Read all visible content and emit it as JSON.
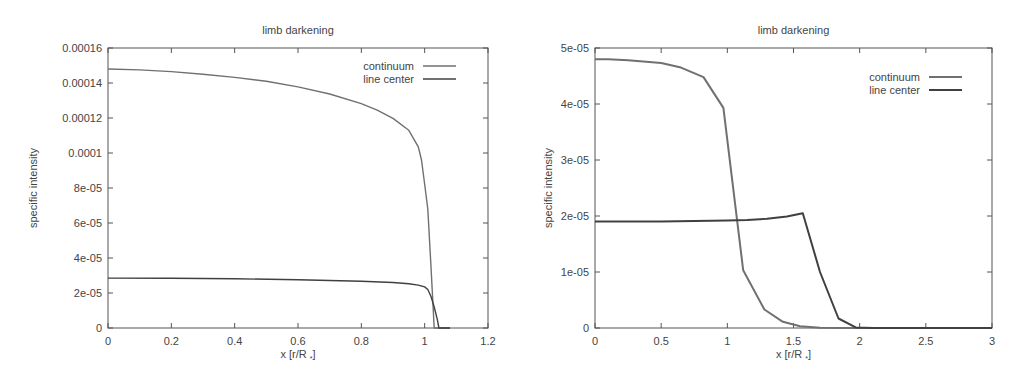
{
  "chart_data": [
    {
      "type": "line",
      "title": "limb darkening",
      "xlabel": "x [r/R *]",
      "ylabel": "specific intensity",
      "xlim": [
        0,
        1.2
      ],
      "ylim": [
        0,
        0.00016
      ],
      "xticks": [
        0,
        0.2,
        0.4,
        0.6,
        0.8,
        1,
        1.2
      ],
      "xtick_labels": [
        "0",
        "0.2",
        "0.4",
        "0.6",
        "0.8",
        "1",
        "1.2"
      ],
      "yticks": [
        0,
        2e-05,
        4e-05,
        6e-05,
        8e-05,
        0.0001,
        0.00012,
        0.00014,
        0.00016
      ],
      "ytick_labels": [
        "0",
        "2e-05",
        "4e-05",
        "6e-05",
        "8e-05",
        "0.0001",
        "0.00012",
        "0.00014",
        "0.00016"
      ],
      "grid": false,
      "legend_position": "top-right",
      "series": [
        {
          "name": "continuum",
          "color": "#707070",
          "x": [
            0,
            0.1,
            0.2,
            0.3,
            0.4,
            0.5,
            0.6,
            0.7,
            0.8,
            0.85,
            0.9,
            0.95,
            0.98,
            0.99,
            1.0,
            1.01,
            1.02,
            1.03,
            1.08
          ],
          "y": [
            0.000148,
            0.0001475,
            0.0001465,
            0.000145,
            0.0001432,
            0.000141,
            0.0001378,
            0.0001337,
            0.0001282,
            0.0001245,
            0.0001198,
            0.000113,
            0.0001035,
            9.6e-05,
            8.2e-05,
            6.8e-05,
            3.5e-05,
            0.0,
            0.0
          ]
        },
        {
          "name": "line center",
          "color": "#404040",
          "x": [
            0,
            0.2,
            0.4,
            0.6,
            0.8,
            0.9,
            0.95,
            0.98,
            1.0,
            1.01,
            1.02,
            1.03,
            1.04,
            1.045,
            1.08
          ],
          "y": [
            2.85e-05,
            2.84e-05,
            2.81e-05,
            2.76e-05,
            2.67e-05,
            2.6e-05,
            2.53e-05,
            2.45e-05,
            2.35e-05,
            2.2e-05,
            1.8e-05,
            1.2e-05,
            5e-06,
            0.0,
            0.0
          ]
        }
      ]
    },
    {
      "type": "line",
      "title": "limb darkening",
      "xlabel": "x [r/R *]",
      "ylabel": "specific intensity",
      "xlim": [
        0,
        3
      ],
      "ylim": [
        0,
        5e-05
      ],
      "xticks": [
        0,
        0.5,
        1,
        1.5,
        2,
        2.5,
        3
      ],
      "xtick_labels": [
        "0",
        "0.5",
        "1",
        "1.5",
        "2",
        "2.5",
        "3"
      ],
      "yticks": [
        0,
        1e-05,
        2e-05,
        3e-05,
        4e-05,
        5e-05
      ],
      "ytick_labels": [
        "0",
        "1e-05",
        "2e-05",
        "3e-05",
        "4e-05",
        "5e-05"
      ],
      "grid": false,
      "legend_position": "top-right",
      "series": [
        {
          "name": "continuum",
          "color": "#707070",
          "x": [
            0,
            0.1,
            0.25,
            0.5,
            0.65,
            0.82,
            0.97,
            1.12,
            1.28,
            1.42,
            1.55,
            1.7,
            1.9,
            2.2,
            3.0
          ],
          "y": [
            4.8e-05,
            4.8e-05,
            4.78e-05,
            4.73e-05,
            4.65e-05,
            4.48e-05,
            3.93e-05,
            1.03e-05,
            3.3e-06,
            1.1e-06,
            3e-07,
            5e-08,
            0.0,
            0.0,
            0.0
          ]
        },
        {
          "name": "line center",
          "color": "#404040",
          "x": [
            0,
            0.25,
            0.5,
            0.75,
            1.0,
            1.15,
            1.3,
            1.45,
            1.57,
            1.7,
            1.84,
            1.97,
            2.1,
            3.0
          ],
          "y": [
            1.9e-05,
            1.9e-05,
            1.9e-05,
            1.91e-05,
            1.92e-05,
            1.93e-05,
            1.95e-05,
            1.99e-05,
            2.05e-05,
            1e-05,
            1.7e-06,
            1e-07,
            0.0,
            0.0
          ]
        }
      ]
    }
  ],
  "panels": [
    {
      "title": "limb darkening",
      "xlabel_main": "x [r/R",
      "xlabel_sub": "*",
      "xlabel_close": "]",
      "ylabel": "specific intensity",
      "legend": [
        "continuum",
        "line center"
      ]
    },
    {
      "title": "limb darkening",
      "xlabel_main": "x [r/R",
      "xlabel_sub": "*",
      "xlabel_close": "]",
      "ylabel": "specific intensity",
      "legend": [
        "continuum",
        "line center"
      ]
    }
  ]
}
